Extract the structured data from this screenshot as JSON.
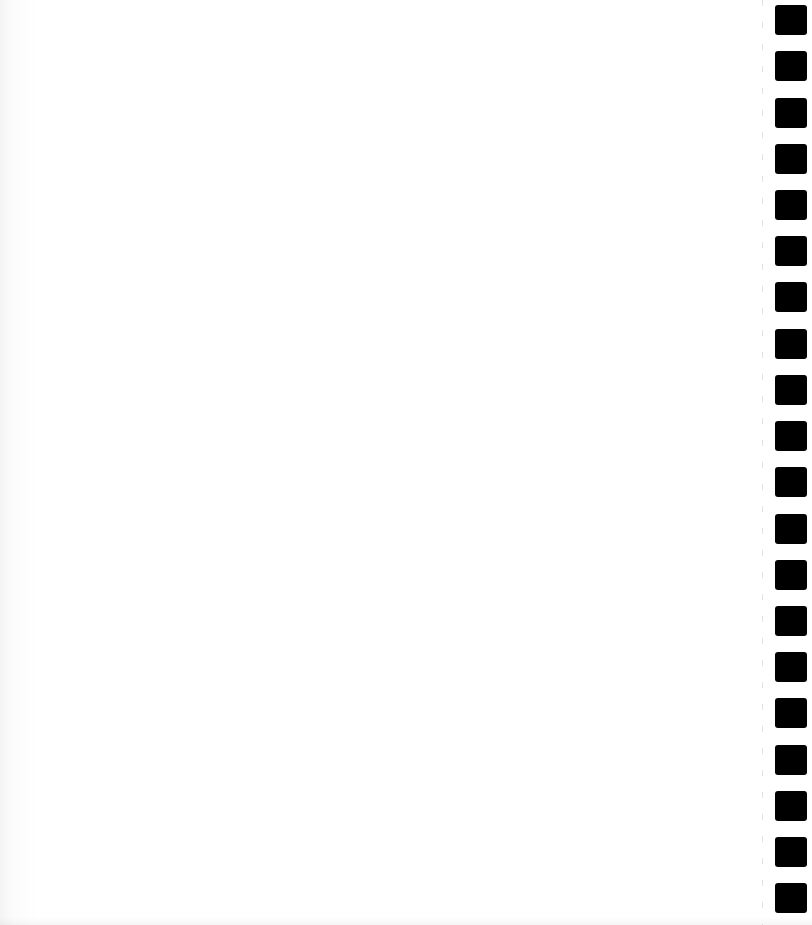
{
  "document": {
    "type": "blank scanned page",
    "text": "",
    "background_color": "#ffffff",
    "binding": {
      "side": "right",
      "hole_count": 20,
      "hole_color": "#000000",
      "hole_tops_px": [
        5,
        51,
        98,
        144,
        190,
        236,
        282,
        329,
        375,
        421,
        467,
        514,
        560,
        606,
        652,
        698,
        745,
        791,
        837,
        883
      ]
    }
  }
}
